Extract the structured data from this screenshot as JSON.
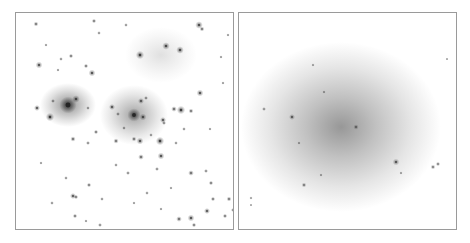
{
  "figure": {
    "panels": [
      {
        "id": "optical",
        "description": "Optical image of galaxy cluster field (inverted grayscale)",
        "halos": [
          {
            "x": 52,
            "y": 92,
            "rx": 28,
            "ry": 22,
            "opacity": 0.55
          },
          {
            "x": 118,
            "y": 102,
            "rx": 34,
            "ry": 30,
            "opacity": 0.45
          },
          {
            "x": 145,
            "y": 42,
            "rx": 36,
            "ry": 28,
            "opacity": 0.15
          }
        ],
        "sources": [
          [
            52,
            92,
            4.5
          ],
          [
            118,
            102,
            3.5
          ],
          [
            60,
            86,
            2
          ],
          [
            34,
            104,
            2.2
          ],
          [
            127,
            104,
            1.8
          ],
          [
            125,
            88,
            1.6
          ],
          [
            96,
            94,
            1.6
          ],
          [
            124,
            128,
            1.8
          ],
          [
            144,
            128,
            2.2
          ],
          [
            165,
            97,
            2.2
          ],
          [
            158,
            96,
            1.5
          ],
          [
            124,
            42,
            2.2
          ],
          [
            150,
            33,
            2
          ],
          [
            164,
            37,
            2
          ],
          [
            183,
            12,
            2
          ],
          [
            186,
            16,
            1.3
          ],
          [
            76,
            60,
            1.8
          ],
          [
            23,
            52,
            1.8
          ],
          [
            21,
            95,
            1.6
          ],
          [
            145,
            143,
            1.8
          ],
          [
            175,
            160,
            1.5
          ],
          [
            125,
            144,
            1.5
          ],
          [
            100,
            128,
            1.4
          ],
          [
            57,
            126,
            1.4
          ],
          [
            80,
            119,
            1.2
          ],
          [
            184,
            80,
            1.8
          ],
          [
            175,
            98,
            1.3
          ],
          [
            195,
            170,
            1.2
          ],
          [
            191,
            198,
            1.6
          ],
          [
            175,
            205,
            1.8
          ],
          [
            163,
            206,
            1.5
          ],
          [
            178,
            212,
            1.2
          ],
          [
            20,
            11,
            1.3
          ],
          [
            70,
            53,
            1.2
          ],
          [
            55,
            43,
            1.2
          ],
          [
            78,
            8,
            1.2
          ],
          [
            147,
            107,
            1.6
          ],
          [
            118,
            126,
            1.3
          ],
          [
            73,
            172,
            1.2
          ],
          [
            57,
            183,
            1.6
          ],
          [
            60,
            184,
            1.2
          ],
          [
            59,
            203,
            1.2
          ],
          [
            213,
            186,
            1.3
          ],
          [
            197,
            186,
            1.2
          ],
          [
            209,
            203,
            1.2
          ],
          [
            148,
            110,
            1.1
          ],
          [
            130,
            85,
            1.1
          ],
          [
            72,
            130,
            1.1
          ],
          [
            102,
            101,
            1.1
          ],
          [
            141,
            156,
            1.1
          ],
          [
            112,
            160,
            1.1
          ],
          [
            190,
            158,
            1.1
          ],
          [
            217,
            197,
            1.1
          ],
          [
            84,
            212,
            1.1
          ],
          [
            37,
            88,
            1.1
          ],
          [
            110,
            12,
            1
          ],
          [
            83,
            20,
            1
          ],
          [
            45,
            46,
            1
          ],
          [
            72,
            95,
            1
          ],
          [
            108,
            115,
            1
          ],
          [
            135,
            122,
            1
          ],
          [
            160,
            130,
            1
          ],
          [
            168,
            116,
            1
          ],
          [
            86,
            186,
            1
          ],
          [
            100,
            152,
            1
          ],
          [
            131,
            180,
            1
          ],
          [
            50,
            165,
            1
          ],
          [
            36,
            190,
            1
          ],
          [
            25,
            150,
            0.9
          ],
          [
            194,
            116,
            0.9
          ],
          [
            207,
            70,
            0.9
          ],
          [
            205,
            44,
            0.9
          ],
          [
            212,
            22,
            0.9
          ],
          [
            30,
            32,
            0.9
          ],
          [
            42,
            57,
            0.9
          ],
          [
            70,
            208,
            0.9
          ],
          [
            145,
            196,
            0.9
          ],
          [
            155,
            175,
            0.9
          ],
          [
            118,
            190,
            0.9
          ]
        ]
      },
      {
        "id": "xray",
        "description": "Smoothed diffuse emission map of same field (inverted grayscale)",
        "halo": {
          "x": 102,
          "y": 114,
          "rx": 100,
          "ry": 85,
          "opacity": 0.5
        },
        "sources": [
          [
            53,
            104,
            1.6
          ],
          [
            117,
            114,
            1.4
          ],
          [
            157,
            149,
            1.8
          ],
          [
            194,
            154,
            1.3
          ],
          [
            199,
            151,
            1.2
          ],
          [
            65,
            172,
            1.3
          ],
          [
            25,
            96,
            1.1
          ],
          [
            85,
            79,
            0.9
          ],
          [
            74,
            52,
            0.9
          ],
          [
            60,
            130,
            0.9
          ],
          [
            82,
            162,
            0.9
          ],
          [
            162,
            160,
            0.9
          ],
          [
            208,
            46,
            0.8
          ],
          [
            12,
            185,
            0.9
          ],
          [
            12,
            192,
            0.8
          ]
        ]
      }
    ]
  }
}
